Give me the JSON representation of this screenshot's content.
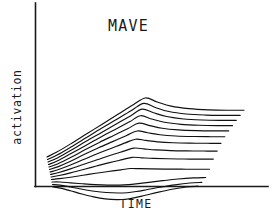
{
  "figure": {
    "title": "MAVE",
    "xlabel": "TIME",
    "ylabel": "activation",
    "background_color": "#ffffff",
    "ink_color": "#111111"
  },
  "chart_data": {
    "type": "line",
    "title": "MAVE",
    "subtitle": "",
    "xlabel": "TIME",
    "ylabel": "activation",
    "grid": false,
    "legend": null,
    "axis_style": "open-L (left spine and bottom spine only, no ticks, no tick labels)",
    "xlim": [
      0,
      1
    ],
    "ylim": [
      0,
      1
    ],
    "x_tick_labels": [],
    "y_tick_labels": [],
    "annotations": [],
    "x": [
      0.0,
      0.05,
      0.12,
      0.2,
      0.28,
      0.36,
      0.44,
      0.5,
      0.56,
      0.63,
      0.72,
      0.82,
      0.92,
      1.0
    ],
    "series": [
      {
        "name": "trace-1",
        "values": [
          0.0,
          0.06,
          0.16,
          0.28,
          0.4,
          0.52,
          0.64,
          0.72,
          0.67,
          0.62,
          0.59,
          0.575,
          0.57,
          0.57
        ]
      },
      {
        "name": "trace-2",
        "values": [
          0.0,
          0.055,
          0.15,
          0.265,
          0.38,
          0.49,
          0.605,
          0.685,
          0.635,
          0.585,
          0.555,
          0.542,
          0.538,
          0.538
        ]
      },
      {
        "name": "trace-3",
        "values": [
          0.0,
          0.05,
          0.14,
          0.25,
          0.355,
          0.46,
          0.565,
          0.645,
          0.6,
          0.555,
          0.525,
          0.512,
          0.508,
          0.508
        ]
      },
      {
        "name": "trace-4",
        "values": [
          0.0,
          0.045,
          0.13,
          0.23,
          0.33,
          0.425,
          0.52,
          0.595,
          0.555,
          0.515,
          0.49,
          0.478,
          0.474,
          0.474
        ]
      },
      {
        "name": "trace-5",
        "values": [
          0.0,
          0.04,
          0.115,
          0.21,
          0.3,
          0.385,
          0.47,
          0.535,
          0.505,
          0.472,
          0.452,
          0.443,
          0.44,
          0.44
        ]
      },
      {
        "name": "trace-6",
        "values": [
          0.0,
          0.035,
          0.1,
          0.185,
          0.265,
          0.34,
          0.415,
          0.47,
          0.448,
          0.424,
          0.409,
          0.402,
          0.4,
          0.4
        ]
      },
      {
        "name": "trace-7",
        "values": [
          0.0,
          0.03,
          0.085,
          0.155,
          0.225,
          0.29,
          0.355,
          0.4,
          0.385,
          0.368,
          0.357,
          0.352,
          0.35,
          0.35
        ]
      },
      {
        "name": "trace-8",
        "values": [
          0.0,
          0.024,
          0.068,
          0.125,
          0.18,
          0.235,
          0.285,
          0.322,
          0.312,
          0.3,
          0.292,
          0.288,
          0.286,
          0.286
        ]
      },
      {
        "name": "trace-9",
        "values": [
          0.0,
          0.018,
          0.05,
          0.092,
          0.134,
          0.175,
          0.212,
          0.24,
          0.234,
          0.227,
          0.222,
          0.219,
          0.218,
          0.218
        ]
      },
      {
        "name": "trace-10",
        "values": [
          0.0,
          0.01,
          0.028,
          0.052,
          0.076,
          0.098,
          0.118,
          0.134,
          0.132,
          0.129,
          0.127,
          0.126,
          0.125,
          0.125
        ]
      },
      {
        "name": "trace-11",
        "values": [
          0.0,
          0.0,
          -0.01,
          -0.022,
          -0.032,
          -0.038,
          -0.038,
          -0.032,
          -0.02,
          -0.004,
          0.016,
          0.036,
          0.05,
          0.055
        ]
      },
      {
        "name": "trace-12",
        "values": [
          0.0,
          -0.008,
          -0.03,
          -0.058,
          -0.082,
          -0.098,
          -0.104,
          -0.1,
          -0.086,
          -0.064,
          -0.034,
          -0.004,
          0.018,
          0.026
        ]
      },
      {
        "name": "trace-13",
        "values": [
          0.0,
          -0.014,
          -0.046,
          -0.086,
          -0.12,
          -0.144,
          -0.154,
          -0.15,
          -0.132,
          -0.104,
          -0.066,
          -0.028,
          0.0,
          0.01
        ]
      }
    ]
  }
}
